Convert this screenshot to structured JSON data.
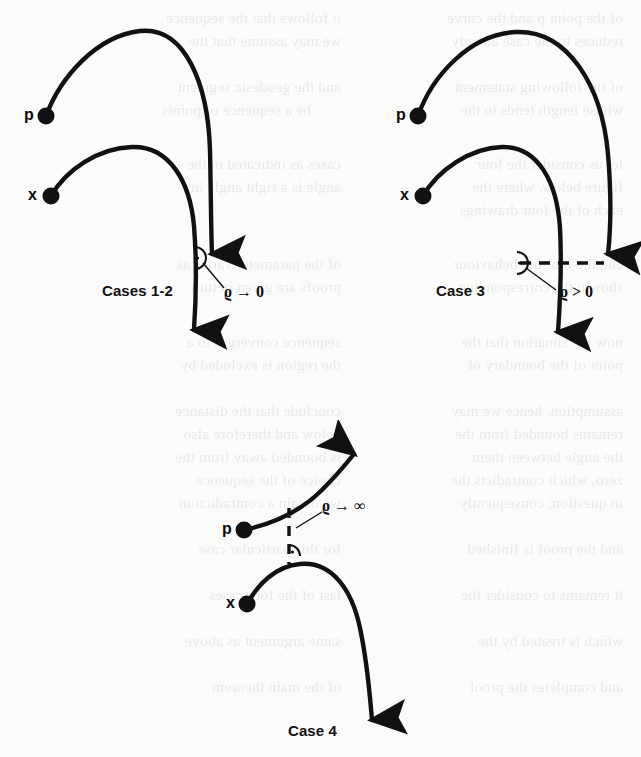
{
  "figure": {
    "kind": "mathematical-diagram",
    "background_color": "#fbfbf9",
    "ink_color": "#111111",
    "panels": [
      {
        "id": "cases-1-2",
        "caption": "Cases 1-2",
        "caption_x": 102,
        "caption_y": 282,
        "point_labels": [
          {
            "name": "p",
            "text": "p",
            "label_x": 24,
            "label_y": 106,
            "dot_x": 46,
            "dot_y": 116
          },
          {
            "name": "x",
            "text": "x",
            "label_x": 28,
            "label_y": 186,
            "dot_x": 51,
            "dot_y": 196
          }
        ],
        "annotation": {
          "text": "ϱ → 0",
          "x": 223,
          "y": 284,
          "leader_from": [
            205,
            262
          ],
          "leader_to": [
            224,
            286
          ]
        },
        "right_angle_marker": {
          "x": 196,
          "y": 258,
          "r": 11,
          "dot": true
        },
        "connector_style": "none"
      },
      {
        "id": "case-3",
        "caption": "Case 3",
        "caption_x": 436,
        "caption_y": 282,
        "point_labels": [
          {
            "name": "p",
            "text": "p",
            "label_x": 396,
            "label_y": 106,
            "dot_x": 418,
            "dot_y": 116
          },
          {
            "name": "x",
            "text": "x",
            "label_x": 400,
            "label_y": 186,
            "dot_x": 423,
            "dot_y": 196
          }
        ],
        "annotation": {
          "text": "ϱ > 0",
          "x": 560,
          "y": 284,
          "leader_from": [
            527,
            268
          ],
          "leader_to": [
            559,
            288
          ]
        },
        "right_angle_marker": {
          "x": 516,
          "y": 258,
          "r": 11,
          "dot": true
        },
        "connector_style": "dashed-horizontal"
      },
      {
        "id": "case-4",
        "caption": "Case 4",
        "caption_x": 288,
        "caption_y": 725,
        "point_labels": [
          {
            "name": "p",
            "text": "p",
            "label_x": 222,
            "label_y": 523,
            "dot_x": 244,
            "dot_y": 530
          },
          {
            "name": "x",
            "text": "x",
            "label_x": 226,
            "label_y": 597,
            "dot_x": 247,
            "dot_y": 604
          }
        ],
        "annotation": {
          "text": "ϱ → ∞",
          "x": 322,
          "y": 505,
          "leader_from": [
            296,
            528
          ],
          "leader_to": [
            320,
            512
          ]
        },
        "right_angle_marker": {
          "x": 288,
          "y": 556,
          "r": 11,
          "dot": true
        },
        "connector_style": "dashed-vertical"
      }
    ],
    "symbols": {
      "rho_to_zero": "ϱ → 0",
      "rho_positive": "ϱ > 0",
      "rho_to_infinity": "ϱ → ∞",
      "point_p": "p",
      "point_x": "x"
    },
    "bleed_through_text": [
      {
        "text": "of the point p and the curve",
        "x": 18,
        "y": 6
      },
      {
        "text": "it follows that the sequence",
        "x": 300,
        "y": 6
      },
      {
        "text": "reduces to the case already",
        "x": 18,
        "y": 29
      },
      {
        "text": "we may assume that the",
        "x": 300,
        "y": 29
      },
      {
        "text": "of the following statement",
        "x": 18,
        "y": 75
      },
      {
        "text": "and the geodesic segment",
        "x": 300,
        "y": 75
      },
      {
        "text": "whose length tends to the",
        "x": 18,
        "y": 98
      },
      {
        "text": "be a sequence of points",
        "x": 330,
        "y": 98
      },
      {
        "text": "let us consider the four",
        "x": 18,
        "y": 152
      },
      {
        "text": "cases as indicated in the",
        "x": 300,
        "y": 152
      },
      {
        "text": "figure below, where the",
        "x": 18,
        "y": 175
      },
      {
        "text": "angle is a right angle in",
        "x": 300,
        "y": 175
      },
      {
        "text": "each of the four drawings",
        "x": 18,
        "y": 198
      },
      {
        "text": "and the limiting behaviour",
        "x": 18,
        "y": 252
      },
      {
        "text": "of the parameter varies as",
        "x": 300,
        "y": 252
      },
      {
        "text": "shown; the corresponding",
        "x": 18,
        "y": 275
      },
      {
        "text": "proofs are given in turn",
        "x": 300,
        "y": 275
      },
      {
        "text": "now the situation that the",
        "x": 18,
        "y": 330
      },
      {
        "text": "sequence converges to a",
        "x": 300,
        "y": 330
      },
      {
        "text": "point of the boundary of",
        "x": 18,
        "y": 353
      },
      {
        "text": "the region is excluded by",
        "x": 300,
        "y": 353
      },
      {
        "text": "assumption, hence we may",
        "x": 18,
        "y": 399
      },
      {
        "text": "conclude that the distance",
        "x": 300,
        "y": 399
      },
      {
        "text": "remains bounded from the",
        "x": 18,
        "y": 422
      },
      {
        "text": "below and therefore also",
        "x": 300,
        "y": 422
      },
      {
        "text": "the angle between them",
        "x": 18,
        "y": 445
      },
      {
        "text": "is bounded away from the",
        "x": 300,
        "y": 445
      },
      {
        "text": "zero, which contradicts the",
        "x": 18,
        "y": 468
      },
      {
        "text": "choice of the sequence",
        "x": 300,
        "y": 468
      },
      {
        "text": "in question; consequently",
        "x": 18,
        "y": 491
      },
      {
        "text": "we obtain a contradiction",
        "x": 300,
        "y": 491
      },
      {
        "text": "and the proof is finished",
        "x": 18,
        "y": 537
      },
      {
        "text": "for this particular case",
        "x": 300,
        "y": 537
      },
      {
        "text": "it remains to consider the",
        "x": 18,
        "y": 583
      },
      {
        "text": "last of the four cases",
        "x": 300,
        "y": 583
      },
      {
        "text": "which is treated by the",
        "x": 18,
        "y": 629
      },
      {
        "text": "same argument as above",
        "x": 300,
        "y": 629
      },
      {
        "text": "and completes the proof",
        "x": 18,
        "y": 675
      },
      {
        "text": "of the main theorem",
        "x": 300,
        "y": 675
      }
    ]
  }
}
